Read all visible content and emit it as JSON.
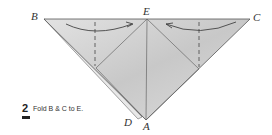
{
  "diagram": {
    "points": {
      "B": {
        "label": "B",
        "x": 44,
        "y": 19
      },
      "E": {
        "label": "E",
        "x": 147,
        "y": 19
      },
      "C": {
        "label": "C",
        "x": 250,
        "y": 19
      },
      "A": {
        "label": "A",
        "x": 146,
        "y": 120
      },
      "D": {
        "label": "D",
        "x": 138,
        "y": 119
      }
    },
    "colors": {
      "paper": "#d8d8d8",
      "paper_dark": "#c4c4c4",
      "edge": "#555555",
      "text": "#333333"
    }
  },
  "step": {
    "number": "2",
    "instruction": "Fold B & C to E."
  }
}
